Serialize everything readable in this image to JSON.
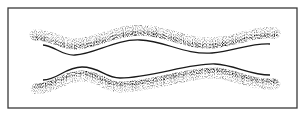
{
  "figure": {
    "frame": {
      "x": 8,
      "y": 8,
      "width": 289,
      "height": 100,
      "stroke": "#3a3a3a"
    },
    "ink_color": "#1a1a1a",
    "bands": [
      {
        "name": "upper-wavy-band",
        "line_path": "M 43 45 C 55 46, 62 56, 75 55 C 95 54, 115 39, 140 40 C 165 41, 185 55, 212 53 C 235 51, 250 43, 270 44",
        "stipple_path": "M 35 35 C 50 34, 60 44, 75 44 C 95 44, 115 30, 140 30 C 165 30, 185 44, 212 43 C 235 42, 255 30, 275 33",
        "stipple_side": "above"
      },
      {
        "name": "lower-wavy-band",
        "line_path": "M 43 80 C 58 80, 65 67, 82 67 C 100 67, 105 78, 120 78 C 150 78, 190 63, 215 64 C 235 65, 250 75, 270 75",
        "stipple_path": "M 36 89 C 55 88, 65 76, 82 76 C 100 76, 105 87, 120 87 C 150 87, 190 72, 215 73 C 235 74, 252 86, 275 84",
        "stipple_side": "below"
      }
    ]
  }
}
